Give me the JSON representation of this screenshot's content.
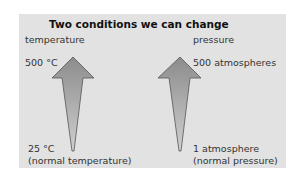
{
  "title": "Two conditions we can change",
  "temperature": {
    "heading": "temperature",
    "high": "500 °C",
    "low": "25 °C",
    "low_note": "(normal temperature)"
  },
  "pressure": {
    "heading": "pressure",
    "high": "500 atmospheres",
    "low": "1 atmosphere",
    "low_note": "(normal pressure)"
  },
  "colors": {
    "panel": "#e2e2e2",
    "arrow_top": "#8c8c8c",
    "arrow_bottom": "#c4c4c4",
    "outline": "#555555"
  }
}
